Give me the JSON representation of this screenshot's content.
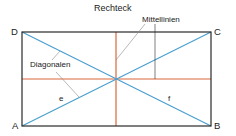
{
  "title": "Rechteck",
  "labels": {
    "middle_lines": "Mittellinien",
    "diagonals": "Diagonalen",
    "diag_e": "e",
    "diag_f": "f"
  },
  "vertices": {
    "A": "A",
    "B": "B",
    "C": "C",
    "D": "D"
  },
  "colors": {
    "outline": "#2a2a2a",
    "diagonal": "#4a9fcf",
    "middle_line": "#d9673a",
    "leader": "#8a8a8a"
  }
}
